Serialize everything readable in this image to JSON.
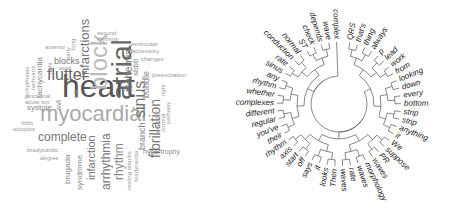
{
  "wordcloud": {
    "words": [
      {
        "text": "heart",
        "size": 32,
        "color": "#555555",
        "x": 62,
        "y": 96,
        "rot": 0
      },
      {
        "text": "atrial",
        "size": 28,
        "color": "#666666",
        "x": 108,
        "y": 100,
        "rot": -90
      },
      {
        "text": "myocardial",
        "size": 22,
        "color": "#aaaaaa",
        "x": 40,
        "y": 121,
        "rot": 0
      },
      {
        "text": "block",
        "size": 24,
        "color": "#bbbbbb",
        "x": 87,
        "y": 90,
        "rot": -90
      },
      {
        "text": "flutter",
        "size": 16,
        "color": "#666666",
        "x": 47,
        "y": 80,
        "rot": 0
      },
      {
        "text": "sinus",
        "size": 16,
        "color": "#777777",
        "x": 132,
        "y": 118,
        "rot": -90
      },
      {
        "text": "infarctions",
        "size": 13,
        "color": "#777777",
        "x": 78,
        "y": 78,
        "rot": -90
      },
      {
        "text": "fibrillation",
        "size": 14,
        "color": "#777777",
        "x": 148,
        "y": 158,
        "rot": -90
      },
      {
        "text": "ischemia",
        "size": 11,
        "color": "#777777",
        "x": 123,
        "y": 92,
        "rot": -90
      },
      {
        "text": "complete",
        "size": 12,
        "color": "#777777",
        "x": 38,
        "y": 141,
        "rot": 0
      },
      {
        "text": "infarction",
        "size": 11,
        "color": "#777777",
        "x": 86,
        "y": 180,
        "rot": -90
      },
      {
        "text": "arrhythmia",
        "size": 12,
        "color": "#777777",
        "x": 100,
        "y": 190,
        "rot": -90
      },
      {
        "text": "rhythm",
        "size": 12,
        "color": "#888888",
        "x": 113,
        "y": 180,
        "rot": -90
      },
      {
        "text": "brugada",
        "size": 8,
        "color": "#888888",
        "x": 64,
        "y": 184,
        "rot": -90
      },
      {
        "text": "syndrome",
        "size": 8,
        "color": "#888888",
        "x": 76,
        "y": 190,
        "rot": -90
      },
      {
        "text": "branch",
        "size": 9,
        "color": "#888888",
        "x": 138,
        "y": 150,
        "rot": -90
      },
      {
        "text": "bundle",
        "size": 9,
        "color": "#888888",
        "x": 142,
        "y": 98,
        "rot": -90
      },
      {
        "text": "sbbb",
        "size": 8,
        "color": "#888888",
        "x": 132,
        "y": 76,
        "rot": -90
      },
      {
        "text": "ischemic",
        "size": 7,
        "color": "#999999",
        "x": 154,
        "y": 137,
        "rot": -90
      },
      {
        "text": "blocks",
        "size": 9,
        "color": "#777777",
        "x": 54,
        "y": 64,
        "rot": 0
      },
      {
        "text": "tachycardia",
        "size": 8,
        "color": "#888888",
        "x": 36,
        "y": 98,
        "rot": -90
      },
      {
        "text": "svt",
        "size": 8,
        "color": "#888888",
        "x": 55,
        "y": 110,
        "rot": -90
      },
      {
        "text": "systole",
        "size": 8,
        "color": "#888888",
        "x": 27,
        "y": 110,
        "rot": 0
      },
      {
        "text": "junctional",
        "size": 6,
        "color": "#999999",
        "x": 25,
        "y": 98,
        "rot": 0
      },
      {
        "text": "acute svt",
        "size": 6,
        "color": "#999999",
        "x": 25,
        "y": 104,
        "rot": 0
      },
      {
        "text": "arrhythmias",
        "size": 6,
        "color": "#999999",
        "x": 24,
        "y": 98,
        "rot": -90
      },
      {
        "text": "tachyarrc",
        "size": 6,
        "color": "#999999",
        "x": 30,
        "y": 90,
        "rot": -90
      },
      {
        "text": "anterior",
        "size": 6,
        "color": "#999999",
        "x": 45,
        "y": 49,
        "rot": 0
      },
      {
        "text": "right",
        "size": 6,
        "color": "#999999",
        "x": 47,
        "y": 74,
        "rot": -90
      },
      {
        "text": "wpw",
        "size": 6,
        "color": "#999999",
        "x": 59,
        "y": 70,
        "rot": 0
      },
      {
        "text": "long",
        "size": 6,
        "color": "#999999",
        "x": 70,
        "y": 50,
        "rot": -90
      },
      {
        "text": "early",
        "size": 6,
        "color": "#999999",
        "x": 65,
        "y": 60,
        "rot": -90
      },
      {
        "text": "left",
        "size": 6,
        "color": "#999999",
        "x": 73,
        "y": 98,
        "rot": -90
      },
      {
        "text": "second",
        "size": 6,
        "color": "#999999",
        "x": 97,
        "y": 35,
        "rot": 0
      },
      {
        "text": "rhythms",
        "size": 6,
        "color": "#999999",
        "x": 97,
        "y": 41,
        "rot": 0
      },
      {
        "text": "ventricular",
        "size": 6,
        "color": "#999999",
        "x": 130,
        "y": 46,
        "rot": 0
      },
      {
        "text": "accessory",
        "size": 6,
        "color": "#999999",
        "x": 132,
        "y": 53,
        "rot": 0
      },
      {
        "text": "changes",
        "size": 6,
        "color": "#999999",
        "x": 141,
        "y": 61,
        "rot": 0
      },
      {
        "text": "preexcitation",
        "size": 6,
        "color": "#999999",
        "x": 152,
        "y": 77,
        "rot": 0
      },
      {
        "text": "right",
        "size": 6,
        "color": "#999999",
        "x": 160,
        "y": 96,
        "rot": -90
      },
      {
        "text": "normal",
        "size": 6,
        "color": "#999999",
        "x": 160,
        "y": 132,
        "rot": -90
      },
      {
        "text": "pathway",
        "size": 6,
        "color": "#999999",
        "x": 165,
        "y": 124,
        "rot": -90
      },
      {
        "text": "hypertrophy",
        "size": 7,
        "color": "#888888",
        "x": 143,
        "y": 154,
        "rot": 0
      },
      {
        "text": "resting attacks",
        "size": 6,
        "color": "#999999",
        "x": 126,
        "y": 190,
        "rot": -90
      },
      {
        "text": "bradycardia",
        "size": 6,
        "color": "#999999",
        "x": 133,
        "y": 182,
        "rot": -90
      },
      {
        "text": "bradycardic",
        "size": 6,
        "color": "#999999",
        "x": 27,
        "y": 152,
        "rot": 0
      },
      {
        "text": "degree",
        "size": 6,
        "color": "#999999",
        "x": 40,
        "y": 160,
        "rot": 0
      },
      {
        "text": "rbbb",
        "size": 6,
        "color": "#999999",
        "x": 21,
        "y": 125,
        "rot": 0
      },
      {
        "text": "ectopics",
        "size": 6,
        "color": "#999999",
        "x": 13,
        "y": 131,
        "rot": 0
      }
    ]
  },
  "dendrogram": {
    "center": [
      114,
      104
    ],
    "inner_radius": 28,
    "leaves": [
      "QRS",
      "that's",
      "thing",
      "always",
      "p",
      "lead",
      "work",
      "from",
      "looking",
      "down",
      "every",
      "bottom",
      "strip",
      "strip",
      "anything",
      "it",
      "We",
      "suppose",
      "PR",
      "waves",
      "morphology",
      "waves",
      "rate",
      "waves",
      "Then",
      "looks",
      "it",
      "says",
      "off",
      "start",
      "axis",
      "rhythm",
      "their",
      "you've",
      "regular",
      "different",
      "complexes",
      "whether",
      "rhythm",
      "any",
      "sinus",
      "rate",
      "conduction",
      "normal",
      "ST",
      "check",
      "depends",
      "wave",
      "complex"
    ]
  }
}
